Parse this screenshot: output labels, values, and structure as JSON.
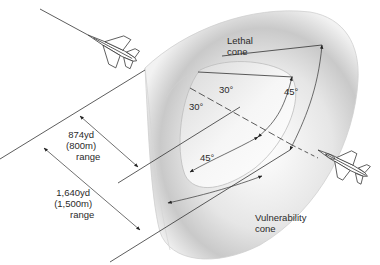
{
  "labels": {
    "lethal_cone": [
      "Lethal",
      "cone"
    ],
    "vulnerability_cone": [
      "Vulnerability",
      "cone"
    ],
    "range_874": [
      "874yd",
      "(800m)",
      "range"
    ],
    "range_1640": [
      "1,640yd",
      "(1,500m)",
      "range"
    ],
    "angle_inner_top": "30°",
    "angle_inner_left": "30°",
    "angle_outer_right": "45°",
    "angle_outer_bottom": "45°"
  },
  "colors": {
    "line": "#333333",
    "cone_light": "#f4f4f4",
    "cone_shade": "#c8c8c8"
  },
  "aircraft": {
    "attacker": "fighter-jet-top-left",
    "target": "fighter-jet-bottom-right"
  }
}
